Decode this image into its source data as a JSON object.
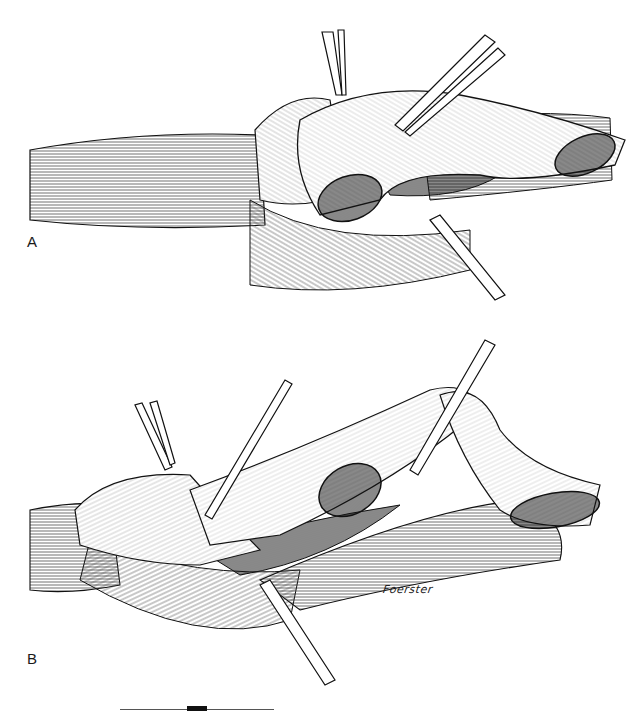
{
  "figure": {
    "type": "surgical illustration",
    "panels": [
      {
        "id": "A",
        "label": "A",
        "description": "Vessel with dissected branch held by forceps, opened lumens shown"
      },
      {
        "id": "B",
        "label": "B",
        "description": "Vessel with everted cuff and two branch stumps retracted by forceps"
      }
    ],
    "signature": "Foerster",
    "scale_bar": {
      "segments": [
        "line",
        "block",
        "line"
      ]
    },
    "colors": {
      "ink": "#111111",
      "paper": "#ffffff",
      "hatch": "#444444"
    }
  }
}
